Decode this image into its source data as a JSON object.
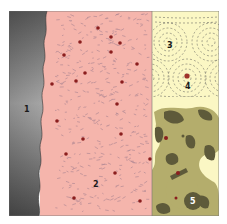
{
  "diagram": {
    "panels": [
      {
        "id": "panel-1",
        "label": "1",
        "fill": "#6b6b6b"
      },
      {
        "id": "panel-2",
        "label": "2",
        "fill": "#f5b5ac"
      },
      {
        "id": "panel-3",
        "label": "3",
        "fill": "#fbf7c4"
      },
      {
        "id": "panel-4",
        "label": "4"
      },
      {
        "id": "panel-5",
        "label": "5",
        "fill": "#fbf7c4"
      }
    ],
    "colors": {
      "metal_dark": "#4d4d4d",
      "metal_light": "#9a9a9a",
      "tissue": "#f5b5ac",
      "dot": "#8b1e1e",
      "cream": "#fbf7c4",
      "camo_mid": "#b4ad6c",
      "camo_dark": "#5e5a3a",
      "line": "#555555"
    },
    "red_dots": [
      [
        98,
        28
      ],
      [
        111,
        37
      ],
      [
        80,
        42
      ],
      [
        120,
        43
      ],
      [
        64,
        55
      ],
      [
        111,
        52
      ],
      [
        137,
        64
      ],
      [
        85,
        73
      ],
      [
        76,
        81
      ],
      [
        52,
        84
      ],
      [
        122,
        82
      ],
      [
        117,
        104
      ],
      [
        57,
        121
      ],
      [
        121,
        134
      ],
      [
        83,
        139
      ],
      [
        66,
        154
      ],
      [
        150,
        159
      ],
      [
        115,
        173
      ],
      [
        74,
        198
      ],
      [
        140,
        201
      ]
    ]
  }
}
